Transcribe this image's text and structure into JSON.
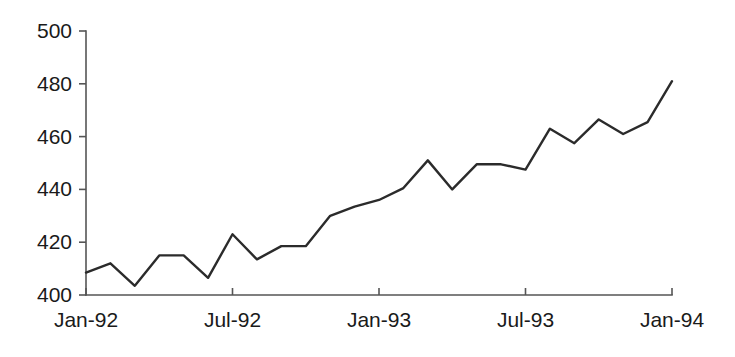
{
  "chart_data": {
    "type": "line",
    "title": "",
    "subtitle": "",
    "xlabel": "",
    "ylabel": "",
    "grid": false,
    "legend": "none",
    "ylim": [
      400,
      500
    ],
    "yticks": [
      400,
      420,
      440,
      460,
      480,
      500
    ],
    "ytick_labels": [
      "400",
      "420",
      "440",
      "460",
      "480",
      "500"
    ],
    "xticks": [
      "Jan-92",
      "Jul-92",
      "Jan-93",
      "Jul-93",
      "Jan-94"
    ],
    "xtick_labels": [
      "Jan-92",
      "Jul-92",
      "Jan-93",
      "Jul-93",
      "Jan-94"
    ],
    "x": [
      "Jan-92",
      "Feb-92",
      "Mar-92",
      "Apr-92",
      "May-92",
      "Jun-92",
      "Jul-92",
      "Aug-92",
      "Sep-92",
      "Oct-92",
      "Nov-92",
      "Dec-92",
      "Jan-93",
      "Feb-93",
      "Mar-93",
      "Apr-93",
      "May-93",
      "Jun-93",
      "Jul-93",
      "Aug-93",
      "Sep-93",
      "Oct-93",
      "Nov-93",
      "Dec-93",
      "Jan-94"
    ],
    "values": [
      408.5,
      412.0,
      403.5,
      415.0,
      415.0,
      406.5,
      423.0,
      413.5,
      418.5,
      418.5,
      430.0,
      433.5,
      436.0,
      440.5,
      451.0,
      440.0,
      449.5,
      449.5,
      447.5,
      463.0,
      457.5,
      466.5,
      461.0,
      465.5,
      481.0
    ],
    "series_name": "",
    "line_color": "#2b2b2b",
    "axis_color": "#555555"
  }
}
